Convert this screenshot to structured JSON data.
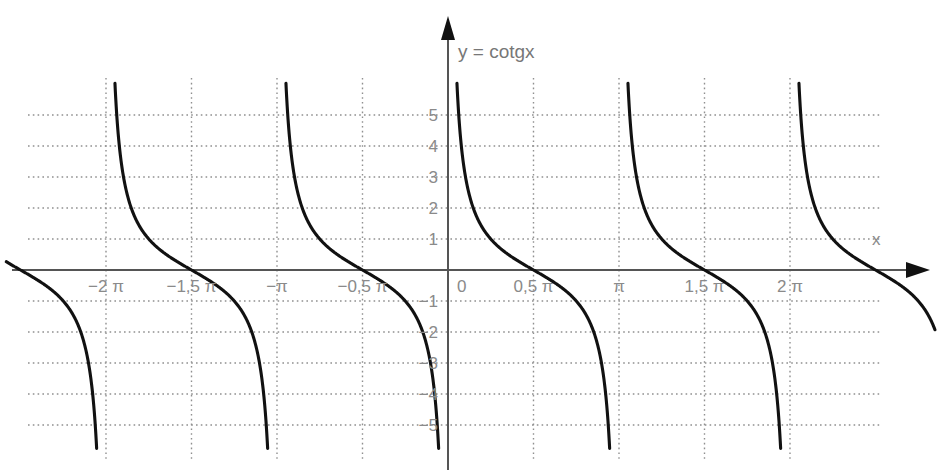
{
  "chart_data": {
    "type": "line",
    "title": "y = cotgx",
    "xlabel": "x",
    "ylabel": "",
    "function": "y = cotg x",
    "xlim": [
      -2.35,
      2.45
    ],
    "ylim": [
      -6.2,
      6.2
    ],
    "x_unit": "pi",
    "grid": true,
    "legend": null,
    "xticks": [
      -2,
      -1.5,
      -1,
      -0.5,
      0,
      0.5,
      1,
      1.5,
      2
    ],
    "xtick_labels": [
      "−2 π",
      "−1,5 π",
      "−π",
      "−0,5 π",
      "0",
      "0,5 π",
      "π",
      "1,5 π",
      "2 π"
    ],
    "yticks": [
      -5,
      -4,
      -3,
      -2,
      -1,
      1,
      2,
      3,
      4,
      5
    ],
    "ytick_labels": [
      "−5",
      "−4",
      "−3",
      "−2",
      "−1",
      "1",
      "2",
      "3",
      "4",
      "5"
    ],
    "asymptotes_x": [
      -2,
      -1,
      0,
      1,
      2
    ],
    "asymptote_labels": [
      "−2π",
      "−π",
      "0",
      "π",
      "2π"
    ],
    "zero_crossings_x": [
      -1.5,
      -0.5,
      0.5,
      1.5
    ],
    "branches": [
      {
        "name": "branch-neg-3pi-to-neg-2pi",
        "domain_pi": [
          -3,
          -2
        ],
        "visible_part": "tail"
      },
      {
        "name": "branch-neg-2pi-to-neg-pi",
        "domain_pi": [
          -2,
          -1
        ],
        "zero_at_pi": -1.5
      },
      {
        "name": "branch-neg-pi-to-0",
        "domain_pi": [
          -1,
          0
        ],
        "zero_at_pi": -0.5
      },
      {
        "name": "branch-0-to-pi",
        "domain_pi": [
          0,
          1
        ],
        "zero_at_pi": 0.5
      },
      {
        "name": "branch-pi-to-2pi",
        "domain_pi": [
          1,
          2
        ],
        "zero_at_pi": 1.5
      },
      {
        "name": "branch-2pi-to-3pi",
        "domain_pi": [
          2,
          3
        ],
        "visible_part": "head"
      }
    ],
    "colors": {
      "curve": "#111111",
      "axis": "#555555",
      "grid": "#909090",
      "label": "#8a8a8a",
      "background": "#ffffff"
    }
  }
}
